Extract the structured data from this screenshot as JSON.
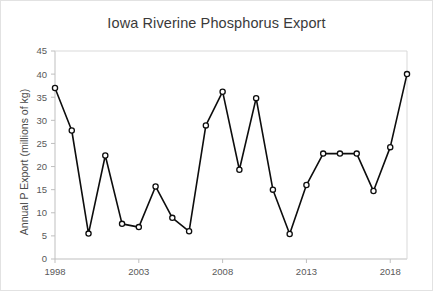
{
  "chart_data": {
    "type": "line",
    "title": "Iowa Riverine Phosphorus Export",
    "xlabel": "",
    "ylabel": "Annual P Export (millions of kg)",
    "xlim": [
      1998,
      2019
    ],
    "ylim": [
      0,
      45
    ],
    "ytick_step": 5,
    "yticks": [
      0,
      5,
      10,
      15,
      20,
      25,
      30,
      35,
      40,
      45
    ],
    "ytick_labels": [
      "0",
      "5",
      "10",
      "15",
      "20",
      "25",
      "30",
      "35",
      "40",
      "45"
    ],
    "xticks": [
      1998,
      2003,
      2008,
      2013,
      2018
    ],
    "xtick_labels": [
      "1998",
      "2003",
      "2008",
      "2013",
      "2018"
    ],
    "grid": false,
    "legend": false,
    "marker": "open-circle",
    "line_color": "#0d0d0d",
    "marker_fill": "#ffffff",
    "x": [
      1998,
      1999,
      2000,
      2001,
      2002,
      2003,
      2004,
      2005,
      2006,
      2007,
      2008,
      2009,
      2010,
      2011,
      2012,
      2013,
      2014,
      2015,
      2016,
      2017,
      2018,
      2019
    ],
    "values": [
      37.0,
      27.8,
      5.5,
      22.4,
      7.6,
      6.9,
      15.7,
      8.9,
      6.0,
      28.9,
      36.2,
      19.3,
      34.8,
      15.0,
      5.4,
      16.0,
      22.8,
      22.8,
      22.8,
      14.7,
      24.2,
      40.0
    ],
    "series": [
      {
        "name": "Annual P Export",
        "values": [
          37.0,
          27.8,
          5.5,
          22.4,
          7.6,
          6.9,
          15.7,
          8.9,
          6.0,
          28.9,
          36.2,
          19.3,
          34.8,
          15.0,
          5.4,
          16.0,
          22.8,
          22.8,
          22.8,
          14.7,
          24.2,
          40.0
        ]
      }
    ]
  }
}
